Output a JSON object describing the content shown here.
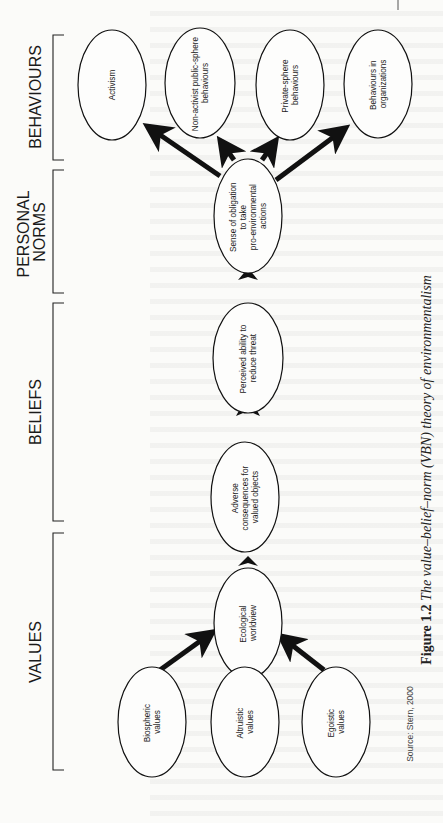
{
  "figure": {
    "caption_label": "Figure 1.2",
    "caption_title": "The value–belief–norm (VBN) theory of environmentalism",
    "source": "Source: Stern, 2000"
  },
  "categories": [
    {
      "id": "behaviours",
      "label_lines": [
        "BEHAVIOURS"
      ]
    },
    {
      "id": "personal-norms",
      "label_lines": [
        "PERSONAL",
        "NORMS"
      ]
    },
    {
      "id": "beliefs",
      "label_lines": [
        "BELIEFS"
      ]
    },
    {
      "id": "values",
      "label_lines": [
        "VALUES"
      ]
    }
  ],
  "nodes": {
    "activism": {
      "lines": [
        "Activism"
      ]
    },
    "non_activist": {
      "lines": [
        "Non-activist public-sphere",
        "behaviours"
      ]
    },
    "private_sphere": {
      "lines": [
        "Private-sphere",
        "behaviours"
      ]
    },
    "organizations": {
      "lines": [
        "Behaviours in",
        "organizations"
      ]
    },
    "obligation": {
      "lines": [
        "Sense of obligation",
        "to take",
        "pro-environmental",
        "actions"
      ]
    },
    "perceived_ability": {
      "lines": [
        "Perceived ability to",
        "reduce threat"
      ]
    },
    "adverse_consequences": {
      "lines": [
        "Adverse",
        "consequences for",
        "valued objects"
      ]
    },
    "ecological_worldview": {
      "lines": [
        "Ecological",
        "worldview"
      ]
    },
    "biospheric": {
      "lines": [
        "Biospheric",
        "values"
      ]
    },
    "altruistic": {
      "lines": [
        "Altruistic",
        "values"
      ]
    },
    "egoistic": {
      "lines": [
        "Egoistic",
        "values"
      ]
    }
  },
  "edges": [
    {
      "from": "biospheric",
      "to": "ecological_worldview"
    },
    {
      "from": "altruistic",
      "to": "ecological_worldview"
    },
    {
      "from": "egoistic",
      "to": "ecological_worldview"
    },
    {
      "from": "ecological_worldview",
      "to": "adverse_consequences"
    },
    {
      "from": "adverse_consequences",
      "to": "perceived_ability"
    },
    {
      "from": "perceived_ability",
      "to": "obligation"
    },
    {
      "from": "obligation",
      "to": "activism"
    },
    {
      "from": "obligation",
      "to": "non_activist"
    },
    {
      "from": "obligation",
      "to": "private_sphere"
    },
    {
      "from": "obligation",
      "to": "organizations"
    }
  ],
  "colors": {
    "ink": "#111111",
    "paper": "#fbfbf9"
  }
}
